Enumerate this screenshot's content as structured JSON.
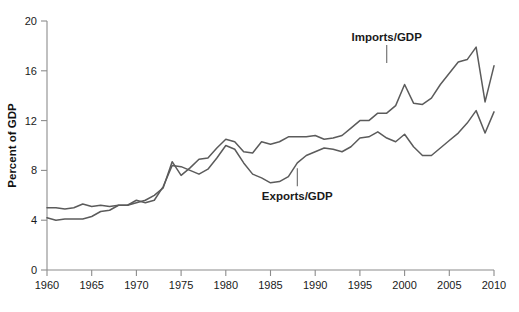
{
  "chart_data": {
    "type": "line",
    "title": "",
    "xlabel": "",
    "ylabel": "Percent of GDP",
    "xlim": [
      1960,
      2010
    ],
    "ylim": [
      0,
      20
    ],
    "grid": false,
    "legend_position": "inline-annotations",
    "xticks": [
      1960,
      1965,
      1970,
      1975,
      1980,
      1985,
      1990,
      1995,
      2000,
      2005,
      2010
    ],
    "yticks": [
      0,
      4,
      8,
      12,
      16,
      20
    ],
    "xtick_labels": [
      "1960",
      "1965",
      "1970",
      "1975",
      "1980",
      "1985",
      "1990",
      "1995",
      "2000",
      "2005",
      "2010"
    ],
    "ytick_labels": [
      "0",
      "4",
      "8",
      "12",
      "16",
      "20"
    ],
    "annotations": [
      {
        "text": "Imports/GDP",
        "series": "Imports/GDP",
        "x": 1998,
        "y": 18.4
      },
      {
        "text": "Exports/GDP",
        "series": "Exports/GDP",
        "x": 1988,
        "y": 5.6
      }
    ],
    "x": [
      1960,
      1961,
      1962,
      1963,
      1964,
      1965,
      1966,
      1967,
      1968,
      1969,
      1970,
      1971,
      1972,
      1973,
      1974,
      1975,
      1976,
      1977,
      1978,
      1979,
      1980,
      1981,
      1982,
      1983,
      1984,
      1985,
      1986,
      1987,
      1988,
      1989,
      1990,
      1991,
      1992,
      1993,
      1994,
      1995,
      1996,
      1997,
      1998,
      1999,
      2000,
      2001,
      2002,
      2003,
      2004,
      2005,
      2006,
      2007,
      2008,
      2009,
      2010
    ],
    "series": [
      {
        "name": "Imports/GDP",
        "color": "#5b5b5b",
        "values": [
          4.2,
          4.0,
          4.1,
          4.1,
          4.1,
          4.3,
          4.7,
          4.8,
          5.2,
          5.2,
          5.4,
          5.6,
          6.0,
          6.6,
          8.7,
          7.6,
          8.2,
          8.9,
          9.0,
          9.8,
          10.5,
          10.3,
          9.5,
          9.4,
          10.3,
          10.1,
          10.3,
          10.7,
          10.7,
          10.7,
          10.8,
          10.5,
          10.6,
          10.8,
          11.4,
          12.0,
          12.0,
          12.6,
          12.6,
          13.2,
          14.9,
          13.4,
          13.3,
          13.8,
          14.9,
          15.8,
          16.7,
          16.9,
          17.9,
          13.5,
          16.4
        ]
      },
      {
        "name": "Exports/GDP",
        "color": "#5b5b5b",
        "values": [
          5.0,
          5.0,
          4.9,
          5.0,
          5.3,
          5.1,
          5.2,
          5.1,
          5.2,
          5.2,
          5.6,
          5.4,
          5.6,
          6.7,
          8.4,
          8.3,
          8.0,
          7.7,
          8.1,
          9.0,
          10.0,
          9.7,
          8.6,
          7.7,
          7.4,
          7.0,
          7.1,
          7.5,
          8.6,
          9.2,
          9.5,
          9.8,
          9.7,
          9.5,
          9.9,
          10.6,
          10.7,
          11.1,
          10.6,
          10.3,
          10.9,
          9.9,
          9.2,
          9.2,
          9.8,
          10.4,
          11.0,
          11.8,
          12.8,
          11.0,
          12.7
        ]
      }
    ]
  },
  "axis": {
    "y_axis_title": "Percent of GDP"
  }
}
